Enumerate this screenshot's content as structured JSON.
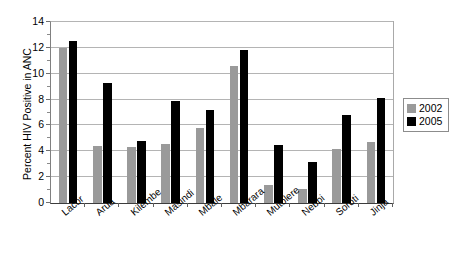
{
  "chart_data": {
    "type": "bar",
    "title": "",
    "xlabel": "",
    "ylabel": "Percent HIV Positive in ANC",
    "ylim": [
      0,
      14
    ],
    "ytick_step": 2,
    "yticks": [
      0,
      2,
      4,
      6,
      8,
      10,
      12,
      14
    ],
    "grid": "horizontal",
    "legend_position": "right",
    "categories": [
      "Lacor",
      "Arua",
      "Kilembe",
      "Masindi",
      "Mbale",
      "Mbarara",
      "Mutolere",
      "Nebbi",
      "Soroti",
      "Jinja"
    ],
    "series": [
      {
        "name": "2002",
        "color": "#9a9a9a",
        "values": [
          12.0,
          4.4,
          4.3,
          4.6,
          5.8,
          10.6,
          1.4,
          1.1,
          4.2,
          4.7
        ]
      },
      {
        "name": "2005",
        "color": "#000000",
        "values": [
          12.5,
          9.3,
          4.8,
          7.9,
          7.2,
          11.8,
          4.5,
          3.2,
          6.8,
          8.1
        ]
      }
    ]
  },
  "legend": {
    "entries": [
      {
        "label": "2002",
        "swatch": "s2002"
      },
      {
        "label": "2005",
        "swatch": "s2005"
      }
    ]
  }
}
